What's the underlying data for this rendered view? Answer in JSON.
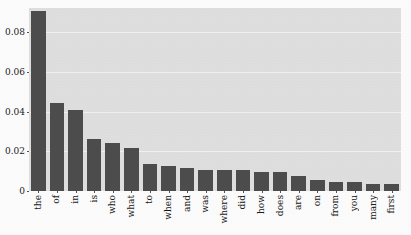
{
  "chart_data": {
    "type": "bar",
    "title": "",
    "subtitle": "",
    "xlabel": "",
    "ylabel": "",
    "categories": [
      "the",
      "of",
      "in",
      "is",
      "who",
      "what",
      "to",
      "when",
      "and",
      "was",
      "where",
      "did",
      "how",
      "does",
      "are",
      "on",
      "from",
      "you",
      "many",
      "first"
    ],
    "values": [
      0.0905,
      0.0443,
      0.0408,
      0.0262,
      0.0243,
      0.0215,
      0.0137,
      0.0126,
      0.0117,
      0.0105,
      0.0105,
      0.0105,
      0.0095,
      0.0094,
      0.0074,
      0.0054,
      0.0044,
      0.0043,
      0.0035,
      0.0035
    ],
    "ylim": [
      0,
      0.0922
    ],
    "xlim_note": "20 categorical bars",
    "yticks": [
      0,
      0.02,
      0.04,
      0.06,
      0.08
    ],
    "ytick_labels": [
      "0",
      "0.02",
      "0.04",
      "0.06",
      "0.08"
    ],
    "grid": true,
    "grid_axis": "y",
    "legend": "none",
    "legend_position": "none",
    "series": [
      {
        "name": "frequency",
        "values": [
          0.0905,
          0.0443,
          0.0408,
          0.0262,
          0.0243,
          0.0215,
          0.0137,
          0.0126,
          0.0117,
          0.0105,
          0.0105,
          0.0105,
          0.0095,
          0.0094,
          0.0074,
          0.0054,
          0.0044,
          0.0043,
          0.0035,
          0.0035
        ]
      }
    ]
  },
  "style": {
    "bar_color": "#4e4e4e",
    "plot_background": "#e2e2e2",
    "figure_background": "#ffffff",
    "grid_color": "#f4f4f4",
    "tick_text_color": "#1a1a1a"
  }
}
